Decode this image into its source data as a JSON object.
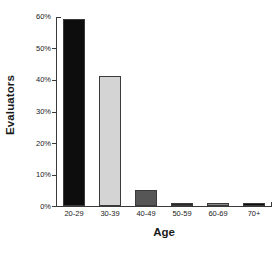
{
  "chart_data": {
    "type": "bar",
    "title": "",
    "xlabel": "Age",
    "ylabel": "Evaluators",
    "categories": [
      "20-29",
      "30-39",
      "40-49",
      "50-59",
      "60-69",
      "70+"
    ],
    "values": [
      59,
      41,
      5,
      1,
      1,
      1
    ],
    "value_labels": [
      "59%",
      "41%",
      "5%",
      "1%",
      "1%",
      "1%"
    ],
    "bar_colors": [
      "#0d0d0d",
      "#d4d4d4",
      "#565656",
      "#2a2a2a",
      "#8a8a8a",
      "#0d0d0d"
    ],
    "bar_edge_color": "#3a3a3a",
    "ylim": [
      0,
      60
    ],
    "yticks": [
      0,
      10,
      20,
      30,
      40,
      50,
      60
    ],
    "ytick_labels": [
      "0%",
      "10%",
      "20%",
      "30%",
      "40%",
      "50%",
      "60%"
    ],
    "grid": false,
    "legend": null,
    "axis_color": "#3a3a3a",
    "background": "#ffffff"
  }
}
